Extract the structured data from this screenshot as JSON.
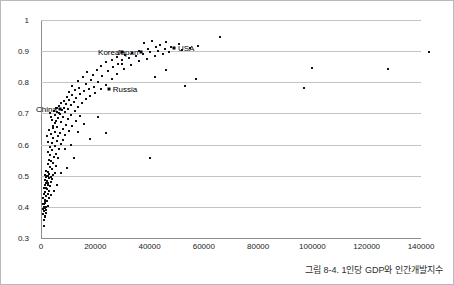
{
  "chart_data": {
    "type": "scatter",
    "title": "",
    "caption": "그림 8-4. 1인당 GDP와 인간개발지수",
    "xlabel": "",
    "ylabel": "",
    "xlim": [
      0,
      140000
    ],
    "ylim": [
      0.3,
      1
    ],
    "xticks": [
      0,
      20000,
      40000,
      60000,
      80000,
      100000,
      120000,
      140000
    ],
    "xtick_labels": [
      "0",
      "20000",
      "40000",
      "60000",
      "80000",
      "100000",
      "120000",
      "140000"
    ],
    "yticks": [
      0.3,
      0.4,
      0.5,
      0.6,
      0.7,
      0.8,
      0.9,
      1
    ],
    "ytick_labels": [
      "0.3",
      "0.4",
      "0.5",
      "0.6",
      "0.7",
      "0.8",
      "0.9",
      "1"
    ],
    "grid": "horizontal",
    "legend": "none",
    "marker": "square",
    "marker_color": "#111111",
    "gridline_color": "#c4c4c4",
    "axis_color": "#8c8c8c",
    "annotations": [
      {
        "label": "China",
        "x": 7000,
        "y": 0.713,
        "side": "left"
      },
      {
        "label": "Russia",
        "x": 25000,
        "y": 0.778,
        "side": "right"
      },
      {
        "label": "Korea",
        "x": 30000,
        "y": 0.898,
        "side": "left"
      },
      {
        "label": "Japan",
        "x": 37000,
        "y": 0.896,
        "side": "left"
      },
      {
        "label": "USA",
        "x": 49000,
        "y": 0.91,
        "side": "right"
      }
    ],
    "points": [
      {
        "x": 1100,
        "y": 0.337
      },
      {
        "x": 1000,
        "y": 0.358
      },
      {
        "x": 1300,
        "y": 0.366
      },
      {
        "x": 1500,
        "y": 0.372
      },
      {
        "x": 900,
        "y": 0.378
      },
      {
        "x": 1700,
        "y": 0.381
      },
      {
        "x": 1200,
        "y": 0.386
      },
      {
        "x": 2000,
        "y": 0.389
      },
      {
        "x": 800,
        "y": 0.392
      },
      {
        "x": 1400,
        "y": 0.396
      },
      {
        "x": 1900,
        "y": 0.398
      },
      {
        "x": 1000,
        "y": 0.401
      },
      {
        "x": 2400,
        "y": 0.404
      },
      {
        "x": 700,
        "y": 0.408
      },
      {
        "x": 1600,
        "y": 0.412
      },
      {
        "x": 2200,
        "y": 0.418
      },
      {
        "x": 1300,
        "y": 0.423
      },
      {
        "x": 2800,
        "y": 0.428
      },
      {
        "x": 1800,
        "y": 0.434
      },
      {
        "x": 2500,
        "y": 0.441
      },
      {
        "x": 1500,
        "y": 0.447
      },
      {
        "x": 3000,
        "y": 0.452
      },
      {
        "x": 2100,
        "y": 0.458
      },
      {
        "x": 1200,
        "y": 0.462
      },
      {
        "x": 3400,
        "y": 0.466
      },
      {
        "x": 2600,
        "y": 0.471
      },
      {
        "x": 1700,
        "y": 0.476
      },
      {
        "x": 3800,
        "y": 0.479
      },
      {
        "x": 2300,
        "y": 0.483
      },
      {
        "x": 1400,
        "y": 0.486
      },
      {
        "x": 4200,
        "y": 0.489
      },
      {
        "x": 2900,
        "y": 0.492
      },
      {
        "x": 1900,
        "y": 0.495
      },
      {
        "x": 3500,
        "y": 0.497
      },
      {
        "x": 2400,
        "y": 0.499
      },
      {
        "x": 4600,
        "y": 0.501
      },
      {
        "x": 1600,
        "y": 0.503
      },
      {
        "x": 3100,
        "y": 0.506
      },
      {
        "x": 5200,
        "y": 0.509
      },
      {
        "x": 2700,
        "y": 0.512
      },
      {
        "x": 2000,
        "y": 0.516
      },
      {
        "x": 4000,
        "y": 0.521
      },
      {
        "x": 3300,
        "y": 0.527
      },
      {
        "x": 5600,
        "y": 0.532
      },
      {
        "x": 2500,
        "y": 0.537
      },
      {
        "x": 4400,
        "y": 0.542
      },
      {
        "x": 3700,
        "y": 0.547
      },
      {
        "x": 2900,
        "y": 0.552
      },
      {
        "x": 6200,
        "y": 0.556
      },
      {
        "x": 4800,
        "y": 0.561
      },
      {
        "x": 3400,
        "y": 0.566
      },
      {
        "x": 5400,
        "y": 0.571
      },
      {
        "x": 2700,
        "y": 0.576
      },
      {
        "x": 4100,
        "y": 0.581
      },
      {
        "x": 6600,
        "y": 0.586
      },
      {
        "x": 3200,
        "y": 0.591
      },
      {
        "x": 5000,
        "y": 0.596
      },
      {
        "x": 7400,
        "y": 0.601
      },
      {
        "x": 3900,
        "y": 0.606
      },
      {
        "x": 5800,
        "y": 0.611
      },
      {
        "x": 8200,
        "y": 0.616
      },
      {
        "x": 4500,
        "y": 0.621
      },
      {
        "x": 6400,
        "y": 0.626
      },
      {
        "x": 9000,
        "y": 0.631
      },
      {
        "x": 3600,
        "y": 0.634
      },
      {
        "x": 7000,
        "y": 0.637
      },
      {
        "x": 5200,
        "y": 0.641
      },
      {
        "x": 10200,
        "y": 0.645
      },
      {
        "x": 8000,
        "y": 0.649
      },
      {
        "x": 4300,
        "y": 0.653
      },
      {
        "x": 6000,
        "y": 0.657
      },
      {
        "x": 11500,
        "y": 0.661
      },
      {
        "x": 9200,
        "y": 0.664
      },
      {
        "x": 5000,
        "y": 0.668
      },
      {
        "x": 7200,
        "y": 0.672
      },
      {
        "x": 13000,
        "y": 0.676
      },
      {
        "x": 4100,
        "y": 0.679
      },
      {
        "x": 10000,
        "y": 0.682
      },
      {
        "x": 6200,
        "y": 0.685
      },
      {
        "x": 8200,
        "y": 0.688
      },
      {
        "x": 14500,
        "y": 0.691
      },
      {
        "x": 5200,
        "y": 0.694
      },
      {
        "x": 11000,
        "y": 0.696
      },
      {
        "x": 7000,
        "y": 0.699
      },
      {
        "x": 3400,
        "y": 0.701
      },
      {
        "x": 9000,
        "y": 0.703
      },
      {
        "x": 6000,
        "y": 0.705
      },
      {
        "x": 12500,
        "y": 0.707
      },
      {
        "x": 4700,
        "y": 0.709
      },
      {
        "x": 7800,
        "y": 0.711
      },
      {
        "x": 10000,
        "y": 0.714
      },
      {
        "x": 5600,
        "y": 0.716
      },
      {
        "x": 8600,
        "y": 0.718
      },
      {
        "x": 13500,
        "y": 0.721
      },
      {
        "x": 6600,
        "y": 0.723
      },
      {
        "x": 11200,
        "y": 0.726
      },
      {
        "x": 9200,
        "y": 0.729
      },
      {
        "x": 7400,
        "y": 0.732
      },
      {
        "x": 15000,
        "y": 0.735
      },
      {
        "x": 12000,
        "y": 0.738
      },
      {
        "x": 8400,
        "y": 0.741
      },
      {
        "x": 10200,
        "y": 0.744
      },
      {
        "x": 16500,
        "y": 0.747
      },
      {
        "x": 13000,
        "y": 0.75
      },
      {
        "x": 9400,
        "y": 0.753
      },
      {
        "x": 18000,
        "y": 0.756
      },
      {
        "x": 11400,
        "y": 0.759
      },
      {
        "x": 14500,
        "y": 0.762
      },
      {
        "x": 20000,
        "y": 0.765
      },
      {
        "x": 10400,
        "y": 0.768
      },
      {
        "x": 16000,
        "y": 0.771
      },
      {
        "x": 12600,
        "y": 0.774
      },
      {
        "x": 22000,
        "y": 0.777
      },
      {
        "x": 17500,
        "y": 0.78
      },
      {
        "x": 14000,
        "y": 0.783
      },
      {
        "x": 19500,
        "y": 0.786
      },
      {
        "x": 11600,
        "y": 0.789
      },
      {
        "x": 24000,
        "y": 0.792
      },
      {
        "x": 16500,
        "y": 0.796
      },
      {
        "x": 21000,
        "y": 0.8
      },
      {
        "x": 13500,
        "y": 0.804
      },
      {
        "x": 18500,
        "y": 0.808
      },
      {
        "x": 26000,
        "y": 0.812
      },
      {
        "x": 15500,
        "y": 0.816
      },
      {
        "x": 22500,
        "y": 0.82
      },
      {
        "x": 19000,
        "y": 0.824
      },
      {
        "x": 28000,
        "y": 0.828
      },
      {
        "x": 17000,
        "y": 0.832
      },
      {
        "x": 24500,
        "y": 0.836
      },
      {
        "x": 20500,
        "y": 0.84
      },
      {
        "x": 30500,
        "y": 0.844
      },
      {
        "x": 26500,
        "y": 0.848
      },
      {
        "x": 22000,
        "y": 0.852
      },
      {
        "x": 33000,
        "y": 0.856
      },
      {
        "x": 28500,
        "y": 0.86
      },
      {
        "x": 24000,
        "y": 0.864
      },
      {
        "x": 36000,
        "y": 0.867
      },
      {
        "x": 30000,
        "y": 0.87
      },
      {
        "x": 26000,
        "y": 0.873
      },
      {
        "x": 39000,
        "y": 0.876
      },
      {
        "x": 32500,
        "y": 0.879
      },
      {
        "x": 28000,
        "y": 0.881
      },
      {
        "x": 42000,
        "y": 0.884
      },
      {
        "x": 35000,
        "y": 0.886
      },
      {
        "x": 31000,
        "y": 0.888
      },
      {
        "x": 45000,
        "y": 0.89
      },
      {
        "x": 37500,
        "y": 0.892
      },
      {
        "x": 33500,
        "y": 0.894
      },
      {
        "x": 40000,
        "y": 0.896
      },
      {
        "x": 47000,
        "y": 0.898
      },
      {
        "x": 43000,
        "y": 0.9
      },
      {
        "x": 36000,
        "y": 0.902
      },
      {
        "x": 52000,
        "y": 0.904
      },
      {
        "x": 45500,
        "y": 0.906
      },
      {
        "x": 39500,
        "y": 0.908
      },
      {
        "x": 55000,
        "y": 0.91
      },
      {
        "x": 42500,
        "y": 0.912
      },
      {
        "x": 48000,
        "y": 0.914
      },
      {
        "x": 58000,
        "y": 0.916
      },
      {
        "x": 44000,
        "y": 0.919
      },
      {
        "x": 51000,
        "y": 0.922
      },
      {
        "x": 38000,
        "y": 0.925
      },
      {
        "x": 46000,
        "y": 0.929
      },
      {
        "x": 41000,
        "y": 0.934
      },
      {
        "x": 66000,
        "y": 0.944
      },
      {
        "x": 30000,
        "y": 0.858
      },
      {
        "x": 46000,
        "y": 0.84
      },
      {
        "x": 42000,
        "y": 0.818
      },
      {
        "x": 57000,
        "y": 0.812
      },
      {
        "x": 53000,
        "y": 0.788
      },
      {
        "x": 100000,
        "y": 0.846
      },
      {
        "x": 97000,
        "y": 0.782
      },
      {
        "x": 128000,
        "y": 0.842
      },
      {
        "x": 143000,
        "y": 0.898
      },
      {
        "x": 40000,
        "y": 0.556
      },
      {
        "x": 24000,
        "y": 0.638
      },
      {
        "x": 18000,
        "y": 0.618
      },
      {
        "x": 12000,
        "y": 0.556
      },
      {
        "x": 9500,
        "y": 0.524
      },
      {
        "x": 7500,
        "y": 0.509
      },
      {
        "x": 16000,
        "y": 0.666
      },
      {
        "x": 21000,
        "y": 0.69
      },
      {
        "x": 13500,
        "y": 0.64
      },
      {
        "x": 11000,
        "y": 0.598
      },
      {
        "x": 6000,
        "y": 0.469
      },
      {
        "x": 4800,
        "y": 0.452
      },
      {
        "x": 3600,
        "y": 0.438
      },
      {
        "x": 8800,
        "y": 0.586
      },
      {
        "x": 5400,
        "y": 0.676
      },
      {
        "x": 4400,
        "y": 0.66
      },
      {
        "x": 3000,
        "y": 0.648
      },
      {
        "x": 2200,
        "y": 0.628
      },
      {
        "x": 2600,
        "y": 0.608
      },
      {
        "x": 3800,
        "y": 0.688
      },
      {
        "x": 6800,
        "y": 0.7
      },
      {
        "x": 5800,
        "y": 0.718
      },
      {
        "x": 1800,
        "y": 0.5
      },
      {
        "x": 2400,
        "y": 0.478
      },
      {
        "x": 1500,
        "y": 0.47
      },
      {
        "x": 2000,
        "y": 0.46
      },
      {
        "x": 1200,
        "y": 0.44
      },
      {
        "x": 900,
        "y": 0.43
      },
      {
        "x": 1600,
        "y": 0.42
      },
      {
        "x": 1100,
        "y": 0.41
      }
    ]
  }
}
